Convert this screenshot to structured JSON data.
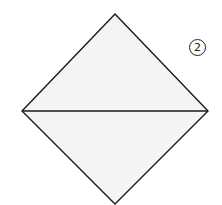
{
  "diagram": {
    "type": "origami-fold-step",
    "step_number": "2",
    "shape": "square rotated 45° (diamond) folded along horizontal diagonal",
    "fill_color": "#f4f4f4",
    "stroke_color": "#1a1a1a",
    "vertices": {
      "top": [
        115,
        14
      ],
      "left": [
        22,
        111
      ],
      "right": [
        208,
        111
      ],
      "bottom": [
        115,
        204
      ]
    }
  }
}
